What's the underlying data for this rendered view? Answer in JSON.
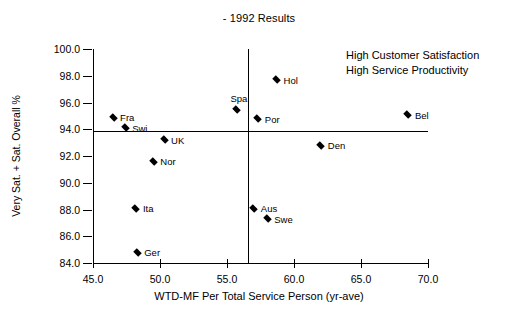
{
  "chart_data": {
    "type": "scatter",
    "title": "- 1992 Results",
    "xlabel": "WTD-MF Per Total Service Person (yr-ave)",
    "ylabel": "Very Sat. + Sat. Overall %",
    "xlim": [
      45.0,
      70.0
    ],
    "ylim": [
      84.0,
      100.0
    ],
    "grid": false,
    "legend": "none",
    "xticks": [
      "45.0",
      "50.0",
      "55.0",
      "60.0",
      "65.0",
      "70.0"
    ],
    "xtick_values": [
      45.0,
      50.0,
      55.0,
      60.0,
      65.0,
      70.0
    ],
    "yticks": [
      "84.0",
      "86.0",
      "88.0",
      "90.0",
      "92.0",
      "94.0",
      "96.0",
      "98.0",
      "100.0"
    ],
    "ytick_values": [
      84.0,
      86.0,
      88.0,
      90.0,
      92.0,
      94.0,
      96.0,
      98.0,
      100.0
    ],
    "reference_lines": {
      "vertical_x": 56.6,
      "horizontal_y": 93.9
    },
    "annotations": [
      "High Customer Satisfaction",
      "High Service Productivity"
    ],
    "points": [
      {
        "label": "Fra",
        "x": 46.5,
        "y": 94.9,
        "label_pos": "right"
      },
      {
        "label": "Swi",
        "x": 47.4,
        "y": 94.1,
        "label_pos": "right"
      },
      {
        "label": "Ita",
        "x": 48.2,
        "y": 88.1,
        "label_pos": "right"
      },
      {
        "label": "Ger",
        "x": 48.3,
        "y": 84.8,
        "label_pos": "right"
      },
      {
        "label": "Nor",
        "x": 49.5,
        "y": 91.6,
        "label_pos": "right"
      },
      {
        "label": "UK",
        "x": 50.3,
        "y": 93.2,
        "label_pos": "right"
      },
      {
        "label": "Spa",
        "x": 55.7,
        "y": 95.5,
        "label_pos": "above"
      },
      {
        "label": "Aus",
        "x": 57.0,
        "y": 88.1,
        "label_pos": "right"
      },
      {
        "label": "Por",
        "x": 57.3,
        "y": 94.8,
        "label_pos": "right"
      },
      {
        "label": "Swe",
        "x": 58.0,
        "y": 87.3,
        "label_pos": "right"
      },
      {
        "label": "Hol",
        "x": 58.7,
        "y": 97.7,
        "label_pos": "right"
      },
      {
        "label": "Den",
        "x": 62.0,
        "y": 92.8,
        "label_pos": "right"
      },
      {
        "label": "Bel",
        "x": 68.5,
        "y": 95.1,
        "label_pos": "right"
      }
    ]
  }
}
